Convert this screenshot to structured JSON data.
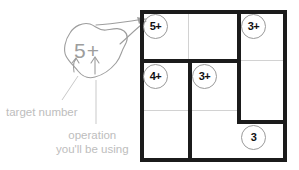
{
  "puzzle": {
    "type": "kenken",
    "size": 3,
    "cages": [
      {
        "id": "cage-5plus",
        "clue": "5+",
        "target": 5,
        "operation": "+",
        "cells": [
          [
            1,
            1
          ],
          [
            1,
            2
          ]
        ]
      },
      {
        "id": "cage-3plus-right",
        "clue": "3+",
        "target": 3,
        "operation": "+",
        "cells": [
          [
            1,
            3
          ],
          [
            2,
            3
          ]
        ]
      },
      {
        "id": "cage-4plus",
        "clue": "4+",
        "target": 4,
        "operation": "+",
        "cells": [
          [
            2,
            1
          ],
          [
            3,
            1
          ]
        ]
      },
      {
        "id": "cage-3plus-mid",
        "clue": "3+",
        "target": 3,
        "operation": "+",
        "cells": [
          [
            2,
            2
          ],
          [
            3,
            2
          ]
        ]
      },
      {
        "id": "cage-3",
        "clue": "3",
        "target": 3,
        "operation": "",
        "cells": [
          [
            3,
            3
          ]
        ]
      }
    ],
    "clue_labels": {
      "top_left": "5+",
      "top_right": "3+",
      "mid_left": "4+",
      "mid_center": "3+",
      "bottom_right": "3"
    }
  },
  "callout": {
    "bubble_label": "5+",
    "target_note": "target number",
    "operation_note_line1": "operation",
    "operation_note_line2": "you'll be using"
  },
  "colors": {
    "cage_stroke": "#1b1b1b",
    "thin_gridline": "#d2d2d2",
    "clue_circle": "#9a9a9a",
    "clue_text": "#111111",
    "annotation_text": "#bdbdbd",
    "callout_stroke": "#9d9d9d",
    "background": "#ffffff"
  }
}
